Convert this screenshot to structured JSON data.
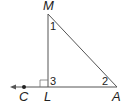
{
  "diagram": {
    "type": "geometry-triangle",
    "vertices": {
      "M": {
        "label": "M",
        "x": 48,
        "y": 14
      },
      "L": {
        "label": "L",
        "x": 48,
        "y": 87
      },
      "A": {
        "label": "A",
        "x": 117,
        "y": 87
      },
      "C": {
        "label": "C",
        "x": 24,
        "y": 87
      }
    },
    "angles": [
      {
        "label": "1",
        "at": "M"
      },
      {
        "label": "2",
        "at": "A"
      },
      {
        "label": "3",
        "at": "L"
      }
    ],
    "right_angle_at": "L",
    "ray": "LC extends left with arrowhead",
    "colors": {
      "line": "#444444",
      "text": "#222222"
    }
  }
}
